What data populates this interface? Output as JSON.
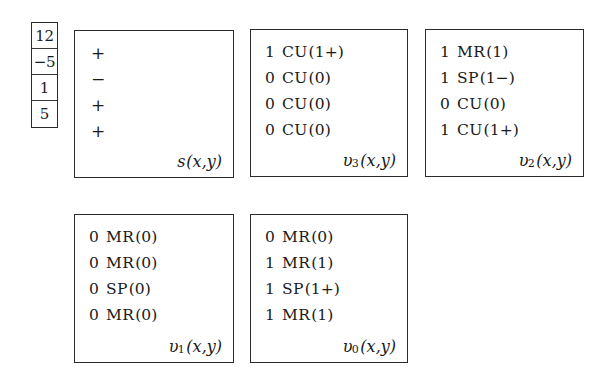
{
  "figure": {
    "type": "bit-slice-decomposition-diagram",
    "value_column": {
      "name": "input-values",
      "cells": [
        "12",
        "−5",
        "1",
        "5"
      ]
    },
    "boxes": [
      {
        "id": "s",
        "caption_name": "s",
        "caption_sub": "",
        "caption_args": "(x,y)",
        "kind": "sign",
        "rows": [
          {
            "sign": "+"
          },
          {
            "sign": "−"
          },
          {
            "sign": "+"
          },
          {
            "sign": "+"
          }
        ]
      },
      {
        "id": "v3",
        "caption_name": "υ",
        "caption_sub": "3",
        "caption_args": "(x,y)",
        "kind": "bits",
        "rows": [
          {
            "bit": "1",
            "mnemonic": "CU",
            "arg": "(1+)"
          },
          {
            "bit": "0",
            "mnemonic": "CU",
            "arg": "(0)"
          },
          {
            "bit": "0",
            "mnemonic": "CU",
            "arg": "(0)"
          },
          {
            "bit": "0",
            "mnemonic": "CU",
            "arg": "(0)"
          }
        ]
      },
      {
        "id": "v2",
        "caption_name": "υ",
        "caption_sub": "2",
        "caption_args": "(x,y)",
        "kind": "bits",
        "rows": [
          {
            "bit": "1",
            "mnemonic": "MR",
            "arg": "(1)"
          },
          {
            "bit": "1",
            "mnemonic": "SP",
            "arg": "(1−)"
          },
          {
            "bit": "0",
            "mnemonic": "CU",
            "arg": "(0)"
          },
          {
            "bit": "1",
            "mnemonic": "CU",
            "arg": "(1+)"
          }
        ]
      },
      {
        "id": "v1",
        "caption_name": "υ",
        "caption_sub": "1",
        "caption_args": "(x,y)",
        "kind": "bits",
        "rows": [
          {
            "bit": "0",
            "mnemonic": "MR",
            "arg": "(0)"
          },
          {
            "bit": "0",
            "mnemonic": "MR",
            "arg": "(0)"
          },
          {
            "bit": "0",
            "mnemonic": "SP",
            "arg": "(0)"
          },
          {
            "bit": "0",
            "mnemonic": "MR",
            "arg": "(0)"
          }
        ]
      },
      {
        "id": "v0",
        "caption_name": "υ",
        "caption_sub": "0",
        "caption_args": "(x,y)",
        "kind": "bits",
        "rows": [
          {
            "bit": "0",
            "mnemonic": "MR",
            "arg": "(0)"
          },
          {
            "bit": "1",
            "mnemonic": "MR",
            "arg": "(1)"
          },
          {
            "bit": "1",
            "mnemonic": "SP",
            "arg": "(1+)"
          },
          {
            "bit": "1",
            "mnemonic": "MR",
            "arg": "(1)"
          }
        ]
      }
    ]
  },
  "colors": {
    "ink": "#1a1a1a",
    "border": "#2b2b2b",
    "background": "#ffffff"
  }
}
